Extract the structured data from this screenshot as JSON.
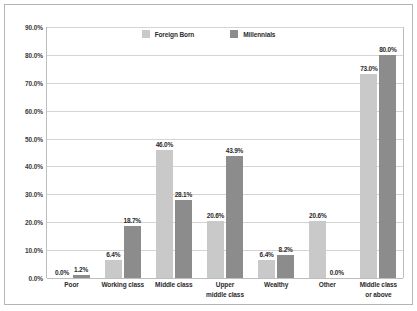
{
  "chart_data": {
    "type": "bar",
    "title": "",
    "subtitle": "",
    "xlabel": "",
    "ylabel": "",
    "ylim": [
      0,
      90
    ],
    "ytick_labels": [
      "90.0%",
      "80.0%",
      "70.0%",
      "60.0%",
      "50.0%",
      "40.0%",
      "30.0%",
      "20.0%",
      "10.0%",
      "0.0%"
    ],
    "ytick_values": [
      90,
      80,
      70,
      60,
      50,
      40,
      30,
      20,
      10,
      0
    ],
    "grid": true,
    "legend_position": "top-center",
    "categories": [
      "Poor",
      "Working class",
      "Middle class",
      "Upper middle class",
      "Wealthy",
      "Other",
      "Middle class or above"
    ],
    "category_lines": [
      [
        "Poor"
      ],
      [
        "Working class"
      ],
      [
        "Middle class"
      ],
      [
        "Upper",
        "middle class"
      ],
      [
        "Wealthy"
      ],
      [
        "Other"
      ],
      [
        "Middle class",
        "or above"
      ]
    ],
    "series": [
      {
        "name": "Foreign Born",
        "color": "#c9c9c9",
        "values": [
          0.0,
          6.4,
          46.0,
          20.6,
          6.4,
          20.6,
          73.0
        ],
        "labels": [
          "0.0%",
          "6.4%",
          "46.0%",
          "20.6%",
          "6.4%",
          "20.6%",
          "73.0%"
        ]
      },
      {
        "name": "Millennials",
        "color": "#8c8c8c",
        "values": [
          1.2,
          18.7,
          28.1,
          43.9,
          8.2,
          0.0,
          80.0
        ],
        "labels": [
          "1.2%",
          "18.7%",
          "28.1%",
          "43.9%",
          "8.2%",
          "0.0%",
          "80.0%"
        ]
      }
    ]
  },
  "legend": {
    "entries": [
      {
        "label": "Foreign Born",
        "color": "#c9c9c9"
      },
      {
        "label": "Millennials",
        "color": "#8c8c8c"
      }
    ]
  }
}
